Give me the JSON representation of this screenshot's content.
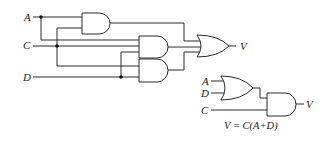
{
  "circuit_left": {
    "inputs": [
      {
        "name": "A",
        "label": "A"
      },
      {
        "name": "C",
        "label": "C"
      },
      {
        "name": "D",
        "label": "D"
      }
    ],
    "gates": [
      {
        "id": "and1",
        "type": "AND",
        "inputs": [
          "A",
          "C"
        ]
      },
      {
        "id": "and2",
        "type": "AND",
        "inputs": [
          "A",
          "C",
          "D"
        ]
      },
      {
        "id": "and3",
        "type": "AND",
        "inputs": [
          "C",
          "D"
        ]
      },
      {
        "id": "or1",
        "type": "OR",
        "inputs": [
          "and1",
          "and2",
          "and3"
        ]
      }
    ],
    "output_label": "V"
  },
  "circuit_right": {
    "inputs": [
      {
        "name": "A",
        "label": "A"
      },
      {
        "name": "D",
        "label": "D"
      },
      {
        "name": "C",
        "label": "C"
      }
    ],
    "gates": [
      {
        "id": "or_small",
        "type": "OR",
        "inputs": [
          "A",
          "D"
        ]
      },
      {
        "id": "and_small",
        "type": "AND",
        "inputs": [
          "or_small",
          "C"
        ]
      }
    ],
    "output_label": "V",
    "equation": "V = C(A+D)"
  }
}
